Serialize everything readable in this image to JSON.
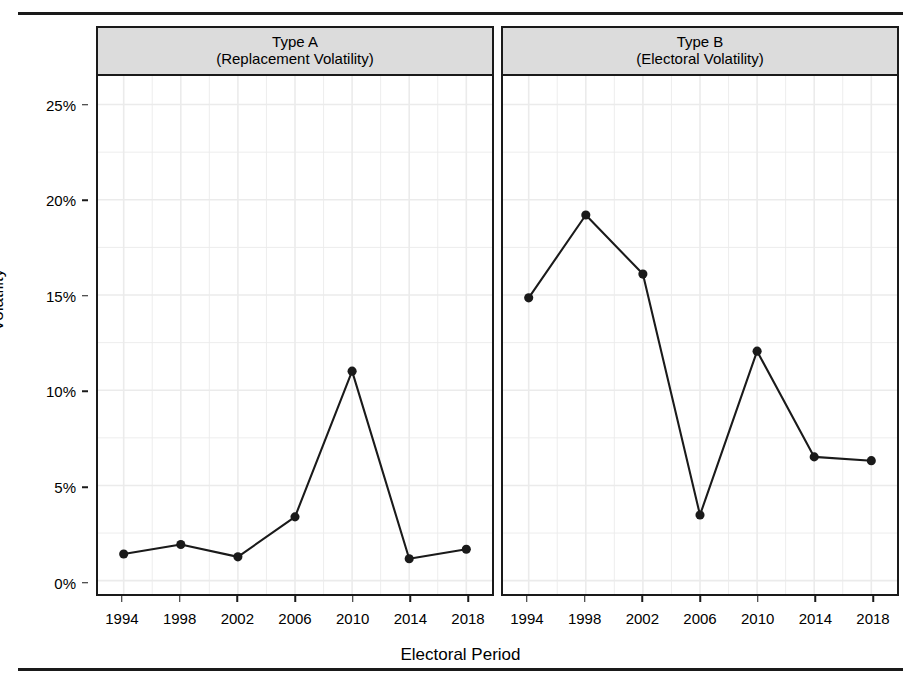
{
  "figure": {
    "background": "#ffffff",
    "rule_color": "#1a1a1a",
    "strip_fill": "#dcdcdc",
    "line_color": "#1a1a1a",
    "grid_color": "#ebebeb"
  },
  "axes": {
    "y_title": "Volatility",
    "x_title": "Electoral Period",
    "y_ticks": [
      "0%",
      "5%",
      "10%",
      "15%",
      "20%",
      "25%"
    ],
    "x_ticks": [
      "1994",
      "1998",
      "2002",
      "2006",
      "2010",
      "2014",
      "2018"
    ]
  },
  "panels": [
    {
      "line1": "Type A",
      "line2": "(Replacement Volatility)"
    },
    {
      "line1": "Type B",
      "line2": "(Electoral Volatility)"
    }
  ],
  "chart_data": {
    "type": "line",
    "title": "",
    "xlabel": "Electoral Period",
    "ylabel": "Volatility",
    "x": [
      1994,
      1998,
      2002,
      2006,
      2010,
      2014,
      2018
    ],
    "xtick_labels": [
      "1994",
      "1998",
      "2002",
      "2006",
      "2010",
      "2014",
      "2018"
    ],
    "ytick_labels": [
      "0%",
      "5%",
      "10%",
      "15%",
      "20%",
      "25%"
    ],
    "ytick_values": [
      0,
      5,
      10,
      15,
      20,
      25
    ],
    "ylim": [
      -0.7,
      26.5
    ],
    "xlim": [
      1992.2,
      2019.8
    ],
    "yunit": "percent",
    "grid": true,
    "legend": "none",
    "facets": [
      "Type A\n(Replacement Volatility)",
      "Type B\n(Electoral Volatility)"
    ],
    "series": [
      {
        "name": "Type A (Replacement Volatility)",
        "panel": "Type A",
        "values": [
          1.4,
          1.9,
          1.25,
          3.35,
          11.0,
          1.15,
          1.65
        ],
        "marker": "filled-circle",
        "color": "#1a1a1a"
      },
      {
        "name": "Type B (Electoral Volatility)",
        "panel": "Type B",
        "values": [
          14.85,
          19.2,
          16.1,
          3.45,
          12.05,
          6.5,
          6.3
        ],
        "marker": "filled-circle",
        "color": "#1a1a1a"
      }
    ]
  }
}
